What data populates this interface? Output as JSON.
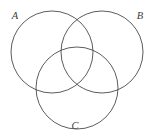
{
  "figure": {
    "kind": "venn-diagram",
    "canvas": {
      "width": 154,
      "height": 136
    },
    "background_color": "#ffffff",
    "stroke_color": "#4a4a4a",
    "stroke_width": 0.9,
    "label_color": "#3d3d3d"
  },
  "chart_data": {
    "type": "diagram",
    "subtype": "venn",
    "title": "",
    "set_count": 3,
    "fill": "none",
    "sets": [
      {
        "id": "A",
        "label": "A",
        "cx": 52,
        "cy": 52,
        "r": 41,
        "label_x": 15,
        "label_y": 17
      },
      {
        "id": "B",
        "label": "B",
        "cx": 102,
        "cy": 52,
        "r": 41,
        "label_x": 140,
        "label_y": 17
      },
      {
        "id": "C",
        "label": "C",
        "cx": 77,
        "cy": 88,
        "r": 41,
        "label_x": 75,
        "label_y": 127
      }
    ],
    "legend": "none",
    "grid": false,
    "axes": false
  },
  "labels": {
    "a": "A",
    "b": "B",
    "c": "C"
  }
}
